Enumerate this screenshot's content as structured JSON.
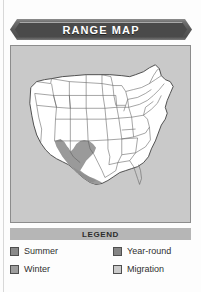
{
  "panel": {
    "title": "RANGE MAP"
  },
  "map": {
    "region_name": "united-states",
    "background_color": "#c9c9c9",
    "land_color": "#ffffff",
    "outline_color": "#4a4a4a",
    "range_shade_color": "#9a9a9a",
    "watermark_icon": "bird-watermark"
  },
  "legend": {
    "heading": "LEGEND",
    "bird_icon": "bird-icon",
    "columns": [
      {
        "items": [
          {
            "label": "Summer",
            "swatch_color": "#8a8a8a",
            "icon": "legend-swatch"
          },
          {
            "label": "Winter",
            "swatch_color": "#9e9e9e",
            "icon": "legend-swatch"
          }
        ]
      },
      {
        "items": [
          {
            "label": "Year-round",
            "swatch_color": "#858585",
            "icon": "legend-swatch"
          },
          {
            "label": "Migration",
            "swatch_color": "#cacaca",
            "icon": "legend-swatch"
          }
        ]
      }
    ]
  }
}
